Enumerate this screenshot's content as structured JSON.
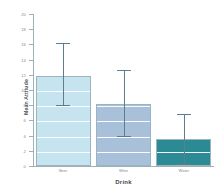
{
  "chart_data": {
    "type": "bar",
    "title": "",
    "xlabel": "Drink",
    "ylabel": "Mean Attitude",
    "categories": [
      "Beer",
      "Wine",
      "Water"
    ],
    "values": [
      11.8,
      8.2,
      3.5
    ],
    "error_high": [
      16.2,
      12.6,
      6.9
    ],
    "error_low": [
      8.0,
      3.9,
      0.2
    ],
    "series": [
      {
        "name": "Mean Attitude",
        "values": [
          11.8,
          8.2,
          3.5
        ]
      }
    ],
    "ylim": [
      0,
      20
    ],
    "ytick_labels": [
      "0",
      "2",
      "4",
      "6",
      "8",
      "10",
      "12",
      "14",
      "16",
      "18",
      "20"
    ],
    "ytick_values": [
      0,
      2,
      4,
      6,
      8,
      10,
      12,
      14,
      16,
      18,
      20
    ],
    "grid": true,
    "grid_color": "#ffffff",
    "legend": false,
    "bar_colors": [
      "#c5e4ef",
      "#a8c0da",
      "#2b8a94"
    ],
    "bar_border_color": "#9ab4c0",
    "error_bar_color": "#5b7f8c",
    "axis_color": "#9fb0b8",
    "background": "#ffffff"
  }
}
